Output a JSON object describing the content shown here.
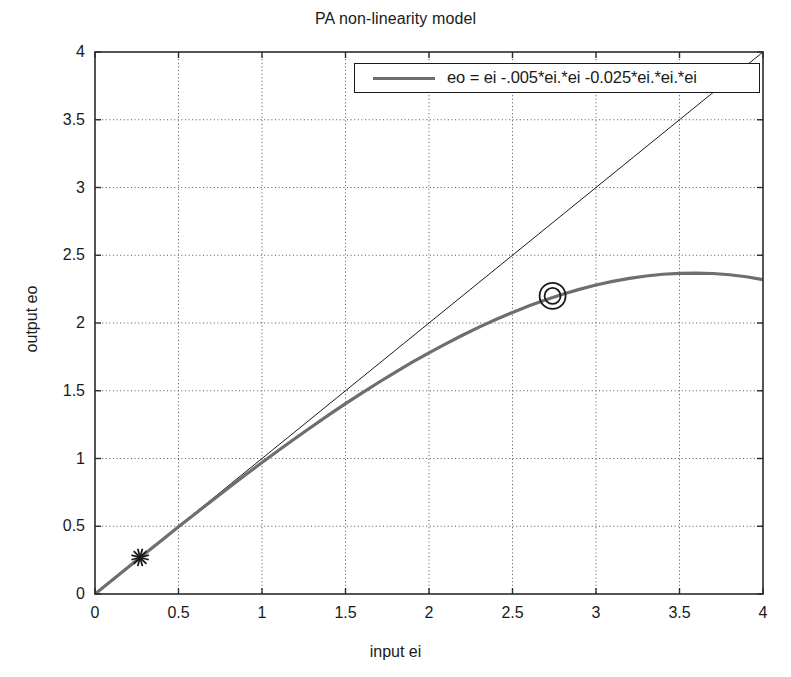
{
  "chart_data": {
    "type": "line",
    "title": "PA non-linearity model",
    "xlabel": "input ei",
    "ylabel": "output eo",
    "xlim": [
      0,
      4
    ],
    "ylim": [
      0,
      4
    ],
    "xticks": [
      "0",
      "0.5",
      "1",
      "1.5",
      "2",
      "2.5",
      "3",
      "3.5",
      "4"
    ],
    "yticks": [
      "0",
      "0.5",
      "1",
      "1.5",
      "2",
      "2.5",
      "3",
      "3.5",
      "4"
    ],
    "xtick_values": [
      0,
      0.5,
      1,
      1.5,
      2,
      2.5,
      3,
      3.5,
      4
    ],
    "ytick_values": [
      0,
      0.5,
      1,
      1.5,
      2,
      2.5,
      3,
      3.5,
      4
    ],
    "grid": true,
    "grid_style": "dotted",
    "legend_position": "top-right",
    "series": [
      {
        "name": "eo = ei -.005*ei.*ei -0.025*ei.*ei.*ei",
        "color": "#6e6e6e",
        "linewidth": 3.2,
        "in_legend": true,
        "x": [
          0,
          0.1,
          0.2,
          0.3,
          0.4,
          0.5,
          0.6,
          0.7,
          0.8,
          0.9,
          1,
          1.1,
          1.2,
          1.3,
          1.4,
          1.5,
          1.6,
          1.7,
          1.8,
          1.9,
          2,
          2.1,
          2.2,
          2.3,
          2.4,
          2.5,
          2.6,
          2.7,
          2.8,
          2.9,
          3,
          3.1,
          3.2,
          3.3,
          3.4,
          3.5,
          3.6,
          3.7,
          3.8,
          3.9,
          4
        ],
        "y": [
          0,
          0.0999,
          0.1996,
          0.2989,
          0.3976,
          0.4956,
          0.5928,
          0.6889,
          0.784,
          0.8778,
          0.97,
          1.0607,
          1.1496,
          1.2366,
          1.3216,
          1.4044,
          1.4848,
          1.5628,
          1.638,
          1.7104,
          1.78,
          1.8464,
          1.9096,
          1.9694,
          2.0256,
          2.0781,
          2.1268,
          2.1714,
          2.212,
          2.2481,
          2.28,
          2.3071,
          2.3296,
          2.3471,
          2.3596,
          2.3669,
          2.3688,
          2.3652,
          2.356,
          2.3411,
          2.32
        ]
      },
      {
        "name": "ideal linear eo = ei",
        "color": "#1a1a1a",
        "linewidth": 1,
        "in_legend": false,
        "x": [
          0,
          4
        ],
        "y": [
          0,
          4
        ]
      }
    ],
    "markers": [
      {
        "name": "asterisk-marker",
        "symbol": "asterisk",
        "x": 0.27,
        "y": 0.27,
        "color": "#1a1a1a"
      },
      {
        "name": "circle-marker",
        "symbol": "double-circle",
        "x": 2.74,
        "y": 2.2,
        "color": "#1a1a1a"
      }
    ]
  }
}
